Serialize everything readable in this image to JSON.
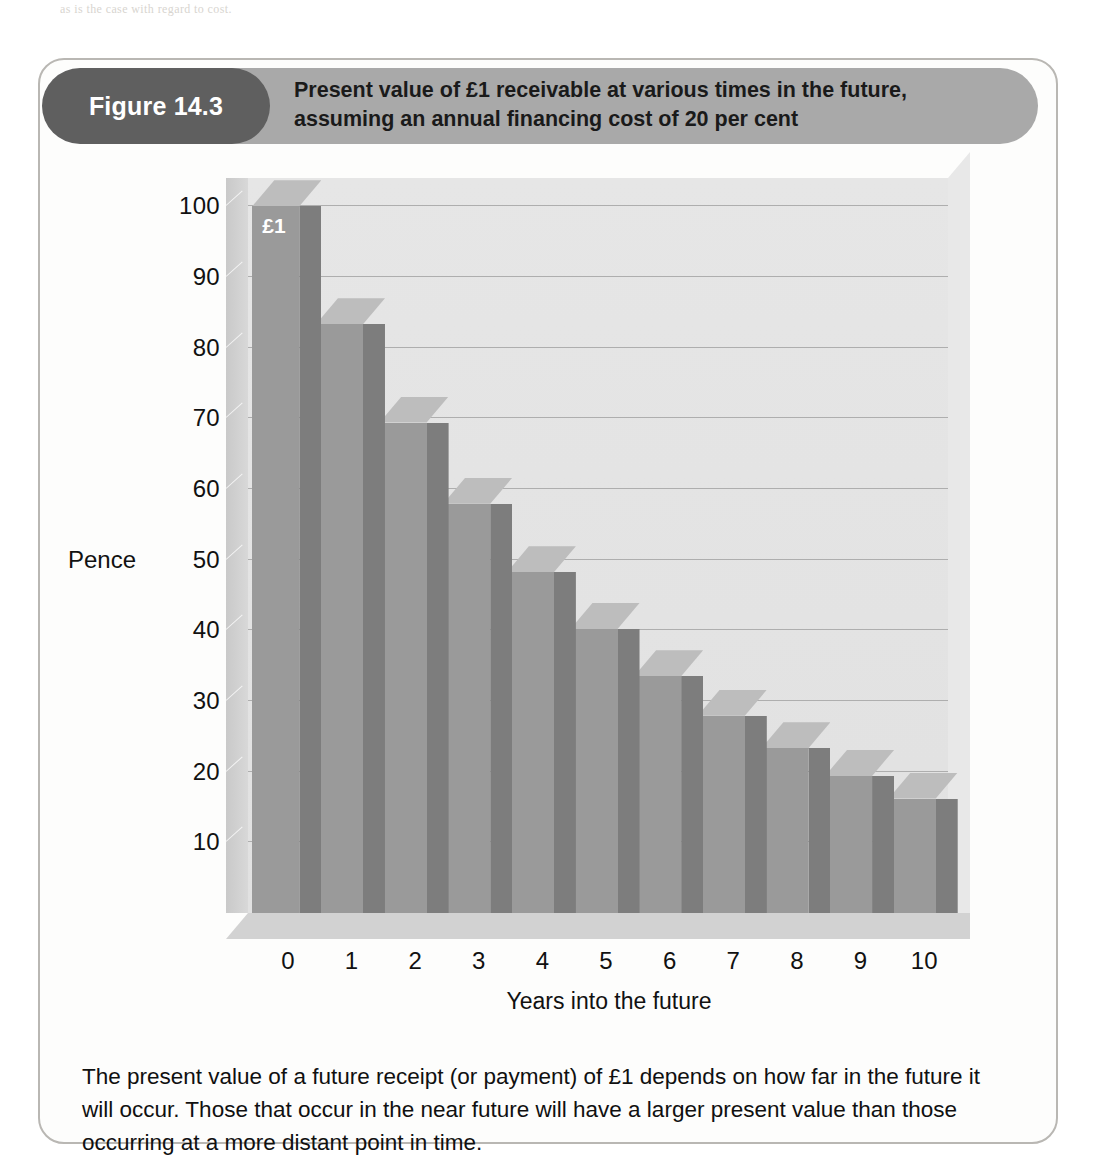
{
  "page": {
    "bleed_text": "as is the case with regard to cost."
  },
  "figure": {
    "number_label": "Figure 14.3",
    "title_line_1": "Present value of £1 receivable at various times in the future,",
    "title_line_2": "assuming an annual financing cost of 20 per cent",
    "caption": "The present value of a future receipt (or payment) of £1 depends on how far in the future it will occur. Those that occur in the near future will have a larger present value than those occurring at a more distant point in time."
  },
  "colors": {
    "banner": "#a9a9a9",
    "pill": "#5f5f5f",
    "bar_front": "#9a9a9a",
    "bar_side": "#7d7d7d",
    "bar_top": "#bdbdbd",
    "plot_background": "#e3e3e3",
    "gridline": "#aeaeae",
    "card_border": "#b9b7b3"
  },
  "chart_data": {
    "type": "bar",
    "title": "Present value of £1 receivable at various times in the future, assuming an annual financing cost of 20 per cent",
    "xlabel": "Years into the future",
    "ylabel": "Pence",
    "categories": [
      "0",
      "1",
      "2",
      "3",
      "4",
      "5",
      "6",
      "7",
      "8",
      "9",
      "10"
    ],
    "values": [
      100,
      83.3,
      69.4,
      57.9,
      48.2,
      40.2,
      33.5,
      27.9,
      23.3,
      19.4,
      16.2
    ],
    "ylim": [
      0,
      104
    ],
    "yticks": [
      10,
      20,
      30,
      40,
      50,
      60,
      70,
      80,
      90,
      100
    ],
    "ytick_labels": [
      "10",
      "20",
      "30",
      "40",
      "50",
      "60",
      "70",
      "80",
      "90",
      "100"
    ],
    "grid": true,
    "legend": false,
    "style": "3d-column",
    "annotations": [
      {
        "category": "0",
        "text": "£1"
      }
    ]
  }
}
